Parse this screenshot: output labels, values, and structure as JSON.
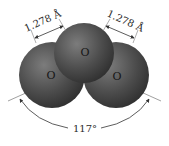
{
  "diagram": {
    "molecule": "O3",
    "atoms": [
      {
        "id": "left",
        "label": "O"
      },
      {
        "id": "center",
        "label": "O"
      },
      {
        "id": "right",
        "label": "O"
      }
    ],
    "bonds": [
      {
        "between": [
          "left",
          "center"
        ],
        "length_label": "1.278 Å"
      },
      {
        "between": [
          "center",
          "right"
        ],
        "length_label": "1.278 Å"
      }
    ],
    "angle": {
      "label": "117°",
      "vertex": "center"
    },
    "colors": {
      "atom_fill": "#4a4a4a",
      "atom_highlight": "#7a7a7a",
      "atom_shadow": "#2a2a2a",
      "line": "#3a3a3a",
      "text": "#2a2a2a"
    }
  }
}
